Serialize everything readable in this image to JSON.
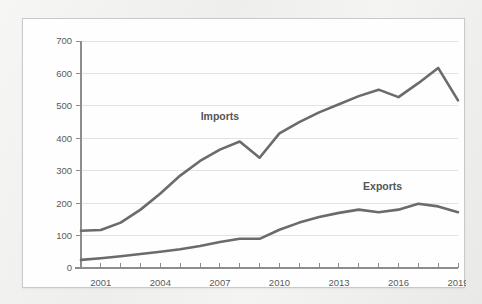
{
  "card": {
    "background_color": "#fefefe",
    "border_color": "#c9c9c9"
  },
  "page": {
    "background_color": "#f2f2f0"
  },
  "chart_data": {
    "type": "line",
    "title": "",
    "subtitle": "",
    "xlabel": "",
    "ylabel": "",
    "xlim": [
      2000,
      2019
    ],
    "ylim": [
      0,
      700
    ],
    "grid": "horizontal",
    "legend_position": "inline-annotation",
    "line_color": "#6b6b6b",
    "x": [
      2000,
      2001,
      2002,
      2003,
      2004,
      2005,
      2006,
      2007,
      2008,
      2009,
      2010,
      2011,
      2012,
      2013,
      2014,
      2015,
      2016,
      2017,
      2018,
      2019
    ],
    "x_tick_labels": [
      "2001",
      "2004",
      "2007",
      "2010",
      "2013",
      "2016",
      "2019"
    ],
    "x_tick_values": [
      2001,
      2004,
      2007,
      2010,
      2013,
      2016,
      2019
    ],
    "y_tick_labels": [
      "0",
      "100",
      "200",
      "300",
      "400",
      "500",
      "600",
      "700"
    ],
    "y_tick_values": [
      0,
      100,
      200,
      300,
      400,
      500,
      600,
      700
    ],
    "series": [
      {
        "name": "Imports",
        "color": "#6b6b6b",
        "label_x": 2007,
        "label_y": 455,
        "values": [
          115,
          117,
          140,
          180,
          230,
          285,
          330,
          365,
          390,
          340,
          415,
          450,
          480,
          505,
          530,
          550,
          527,
          570,
          617,
          517
        ]
      },
      {
        "name": "Exports",
        "color": "#6b6b6b",
        "label_x": 2015.2,
        "label_y": 240,
        "values": [
          25,
          30,
          36,
          43,
          50,
          58,
          68,
          80,
          90,
          90,
          118,
          140,
          157,
          170,
          180,
          172,
          180,
          198,
          190,
          172
        ]
      }
    ],
    "annotations": [
      {
        "text": "Imports",
        "x": 2007,
        "y": 455
      },
      {
        "text": "Exports",
        "x": 2015.2,
        "y": 240
      }
    ]
  }
}
